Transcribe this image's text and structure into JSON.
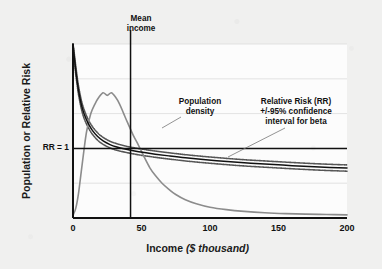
{
  "chart_data": {
    "type": "line",
    "title": "",
    "xlabel": "Income ($ thousand)",
    "xlabel_main": "Income",
    "xlabel_units": "($ thousand)",
    "ylabel": "Population or Relative Risk",
    "xlim": [
      0,
      200
    ],
    "ylim": [
      0,
      1
    ],
    "xticks": [
      0,
      50,
      100,
      150,
      200
    ],
    "xtick_labels": [
      "0",
      "50",
      "100",
      "150",
      "200"
    ],
    "yticks": [],
    "ytick_labels": [],
    "grid": true,
    "grid_horizontal_count": 5,
    "legend": "none",
    "annotations": [
      {
        "name": "mean-income",
        "text": "Mean\nincome",
        "line1": "Mean",
        "line2": "income",
        "x_value": 42,
        "type": "vertical-reference-line"
      },
      {
        "name": "population-density",
        "line1": "Population",
        "line2": "density",
        "line3": "",
        "points_to_x": 57,
        "points_to_y": 0.42
      },
      {
        "name": "relative-risk-ci",
        "line1": "Relative Risk (RR)",
        "line2": "+/-95% confidence",
        "line3": "interval for beta",
        "points_to_x": 113,
        "points_to_y": 0.295
      },
      {
        "name": "rr-equals-one",
        "text": "RR = 1",
        "y_value": 0.4,
        "type": "horizontal-reference-line"
      }
    ],
    "series": [
      {
        "name": "Population density",
        "color": "#8c8c8c",
        "style": "solid",
        "x": [
          0,
          2,
          4,
          6,
          8,
          10,
          13,
          16,
          19,
          22,
          25,
          28,
          31,
          34,
          37,
          40,
          44,
          48,
          52,
          56,
          60,
          65,
          70,
          75,
          82,
          90,
          100,
          112,
          125,
          140,
          155,
          170,
          185,
          200
        ],
        "y": [
          0.015,
          0.055,
          0.14,
          0.265,
          0.39,
          0.5,
          0.6,
          0.655,
          0.695,
          0.72,
          0.705,
          0.72,
          0.695,
          0.655,
          0.6,
          0.545,
          0.475,
          0.415,
          0.35,
          0.29,
          0.245,
          0.2,
          0.165,
          0.135,
          0.105,
          0.082,
          0.062,
          0.048,
          0.038,
          0.03,
          0.025,
          0.022,
          0.02,
          0.018
        ]
      },
      {
        "name": "Relative Risk (RR) central estimate",
        "color": "#111111",
        "style": "solid",
        "x": [
          0,
          1,
          2,
          3,
          4,
          6,
          8,
          11,
          14,
          18,
          22,
          27,
          32,
          38,
          45,
          52,
          60,
          70,
          82,
          95,
          110,
          125,
          140,
          160,
          180,
          200
        ],
        "y": [
          1.0,
          0.92,
          0.85,
          0.79,
          0.735,
          0.655,
          0.6,
          0.545,
          0.505,
          0.468,
          0.443,
          0.422,
          0.408,
          0.396,
          0.385,
          0.376,
          0.367,
          0.357,
          0.346,
          0.336,
          0.326,
          0.317,
          0.31,
          0.301,
          0.293,
          0.287
        ]
      },
      {
        "name": "RR 95% confidence interval upper",
        "color": "#555555",
        "style": "dotted",
        "x": [
          0,
          1,
          2,
          3,
          4,
          6,
          8,
          11,
          14,
          18,
          22,
          27,
          32,
          38,
          45,
          52,
          60,
          70,
          82,
          95,
          110,
          125,
          140,
          160,
          180,
          200
        ],
        "y": [
          1.0,
          0.94,
          0.875,
          0.815,
          0.76,
          0.68,
          0.625,
          0.568,
          0.527,
          0.489,
          0.463,
          0.441,
          0.427,
          0.414,
          0.403,
          0.394,
          0.385,
          0.375,
          0.364,
          0.354,
          0.344,
          0.335,
          0.328,
          0.319,
          0.311,
          0.305
        ]
      },
      {
        "name": "RR 95% confidence interval lower",
        "color": "#555555",
        "style": "dotted",
        "x": [
          0,
          1,
          2,
          3,
          4,
          6,
          8,
          11,
          14,
          18,
          22,
          27,
          32,
          38,
          45,
          52,
          60,
          70,
          82,
          95,
          110,
          125,
          140,
          160,
          180,
          200
        ],
        "y": [
          1.0,
          0.9,
          0.825,
          0.765,
          0.71,
          0.63,
          0.575,
          0.522,
          0.483,
          0.447,
          0.423,
          0.403,
          0.389,
          0.378,
          0.367,
          0.358,
          0.349,
          0.339,
          0.328,
          0.318,
          0.308,
          0.299,
          0.292,
          0.283,
          0.275,
          0.269
        ]
      }
    ],
    "reference_lines": [
      {
        "name": "rr-1-line",
        "orientation": "horizontal",
        "y_value": 0.4,
        "label": "RR = 1",
        "color": "#111111"
      },
      {
        "name": "mean-income-line",
        "orientation": "vertical",
        "x_value": 42,
        "label": "Mean income",
        "color": "#111111"
      }
    ]
  },
  "colors": {
    "background": "#f0f0ef",
    "plot_background": "#fdfdfd",
    "axis": "#111111",
    "grid": "#d8d8d8",
    "density_curve": "#8c8c8c",
    "rr_curve": "#111111",
    "ci_curve": "#555555"
  }
}
